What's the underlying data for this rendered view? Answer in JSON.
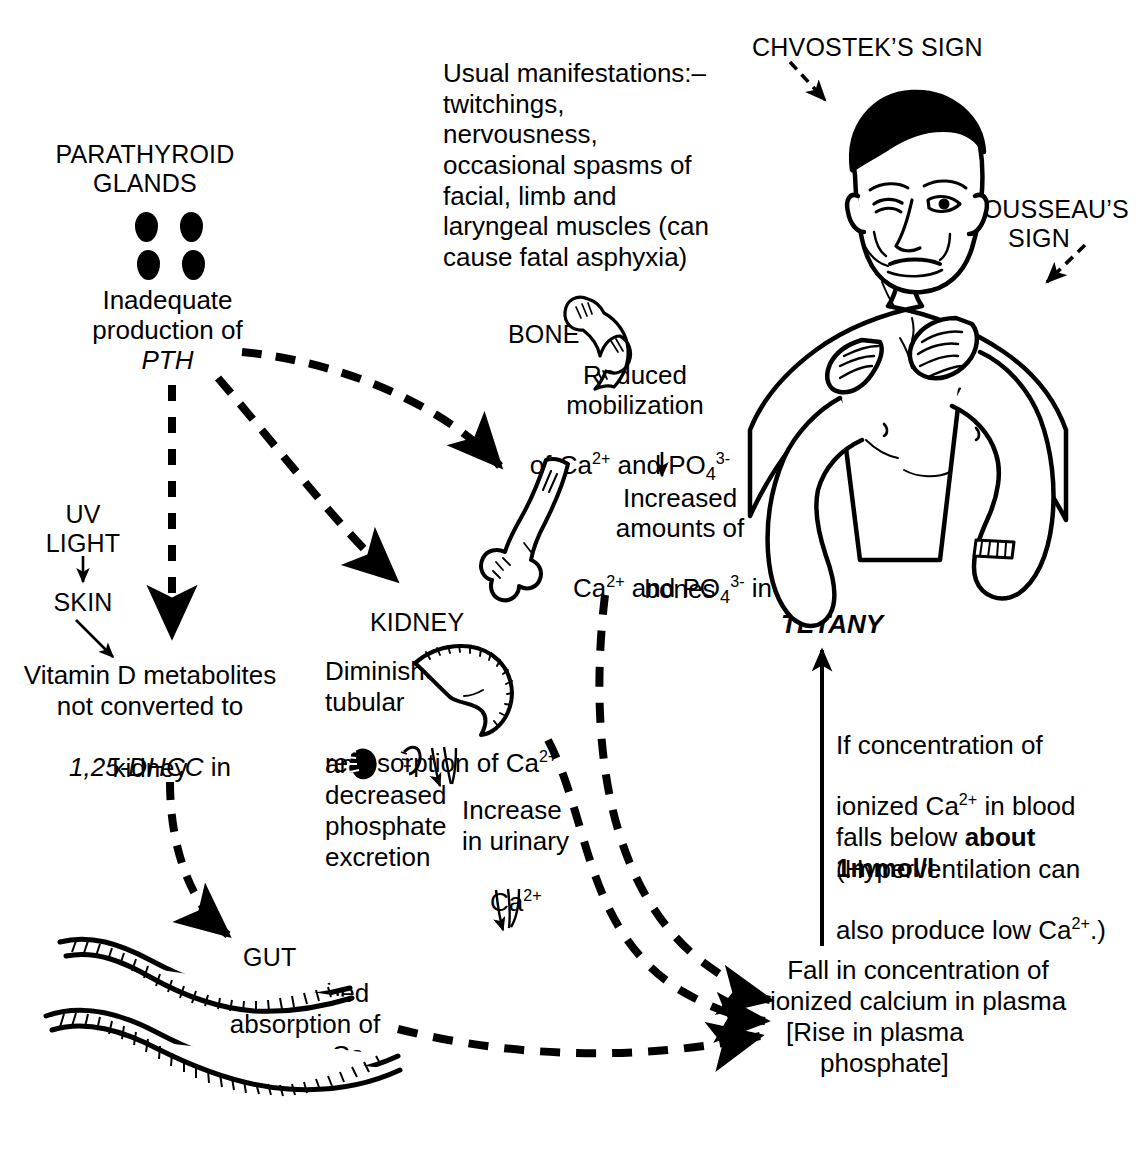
{
  "diagram": {
    "type": "medical-flow-diagram",
    "ink_color": "#000000",
    "background_color": "#ffffff"
  },
  "labels": {
    "parathyroid_glands": "PARATHYROID\nGLANDS",
    "inadequate_pth_line1": "Inadequate",
    "inadequate_pth_line2": "production of",
    "inadequate_pth_line3": "PTH",
    "uv_light": "UV\nLIGHT",
    "skin": "SKIN",
    "vitamin_d_line1": "Vitamin D metabolites",
    "vitamin_d_line2": "not converted to",
    "vitamin_d_line3a": "1,25-DHCC",
    "vitamin_d_line3b": " in",
    "vitamin_d_line4": "kidney",
    "manifestations": "Usual manifestations:–\ntwitchings,\nnervousness,\noccasional spasms of\nfacial, limb and\nlaryngeal muscles (can\ncause fatal asphyxia)",
    "bone": "BONE",
    "reduced_mobilization_line1": "Reduced",
    "reduced_mobilization_line2": "mobilization",
    "reduced_mobilization_line3_pre": "of Ca",
    "reduced_mobilization_line3_sup1": "2+",
    "reduced_mobilization_line3_mid": " and PO",
    "reduced_mobilization_line3_sub": "4",
    "reduced_mobilization_line3_sup2": "3-",
    "increased_amounts_line1": "Increased",
    "increased_amounts_line2": "amounts of",
    "increased_amounts_line3_pre": "Ca",
    "increased_amounts_line3_sup1": "2+",
    "increased_amounts_line3_mid": " and PO",
    "increased_amounts_line3_sub": "4",
    "increased_amounts_line3_sup2": "3-",
    "increased_amounts_line3_post": " in",
    "increased_amounts_line4": "bones",
    "kidney": "KIDNEY",
    "diminished_tubular_line1": "Diminished",
    "diminished_tubular_line2": "tubular",
    "diminished_tubular_line3_pre": "reabsorption of Ca",
    "diminished_tubular_line3_sup": "2+",
    "diminished_tubular_line4": "and",
    "diminished_tubular_line5": "decreased",
    "diminished_tubular_line6": "phosphate",
    "diminished_tubular_line7": "excretion",
    "increase_urinary_line1": "Increase",
    "increase_urinary_line2": "in urinary",
    "increase_urinary_line3_pre": "Ca",
    "increase_urinary_line3_sup": "2+",
    "gut": "GUT",
    "diminished_absorption_line1": "Diminished",
    "diminished_absorption_line2": "absorption of",
    "diminished_absorption_line3": "dietary Ca",
    "tetany": "TETANY",
    "tetany_note_line1": "If concentration of",
    "tetany_note_line2_pre": "ionized Ca",
    "tetany_note_line2_sup": "2+",
    "tetany_note_line2_post": " in blood",
    "tetany_note_line3_pre": "falls below ",
    "tetany_note_line3_bold": "about",
    "tetany_note_line4_bold": "1mmol/l",
    "tetany_note_line4_post": ".",
    "tetany_note_line5": "(Hyperventilation can",
    "tetany_note_line6_pre": "also produce low Ca",
    "tetany_note_line6_sup": "2+",
    "tetany_note_line6_post": ".)",
    "fall_concentration_line1": "Fall in concentration of",
    "fall_concentration_line2": "ionized calcium in plasma",
    "fall_concentration_line3": "[Rise in plasma",
    "fall_concentration_line4": "phosphate]",
    "chvostek_sign": "CHVOSTEK’S SIGN",
    "trousseau_sign": "TROUSSEAU’S\nSIGN"
  },
  "icons": {
    "parathyroid_glands_icon": "four-dark-oval-glands",
    "femur_head_icon": "proximal-femur-bone",
    "long_bone_icon": "long-bone-distal-end",
    "kidney_icon": "kidney-outline",
    "gut_icon": "intestine-loops",
    "patient_icon": "man-torso-with-carpal-spasm"
  },
  "connectors": [
    {
      "name": "pth-to-bone",
      "style": "dashed",
      "from": "Inadequate production of PTH",
      "to": "BONE"
    },
    {
      "name": "pth-to-kidney",
      "style": "dashed",
      "from": "Inadequate production of PTH",
      "to": "KIDNEY"
    },
    {
      "name": "pth-to-vitamin-d",
      "style": "dashed",
      "from": "Inadequate production of PTH",
      "to": "Vitamin D metabolites"
    },
    {
      "name": "vitamin-d-to-gut",
      "style": "dashed",
      "from": "Vitamin D metabolites not converted",
      "to": "GUT"
    },
    {
      "name": "uv-light-to-skin",
      "style": "solid",
      "from": "UV LIGHT",
      "to": "SKIN"
    },
    {
      "name": "skin-to-vitamin-d",
      "style": "solid",
      "from": "SKIN",
      "to": "Vitamin D metabolites"
    },
    {
      "name": "bone-mobilization-to-increased",
      "style": "solid-down-arrow",
      "from": "Reduced mobilization",
      "to": "Increased amounts"
    },
    {
      "name": "bones-to-fall",
      "style": "dashed",
      "from": "bones",
      "to": "Fall in concentration"
    },
    {
      "name": "kidney-to-fall",
      "style": "dashed",
      "from": "Increase in urinary Ca2+",
      "to": "Fall in concentration"
    },
    {
      "name": "gut-to-fall",
      "style": "dashed",
      "from": "Diminished absorption of dietary Ca",
      "to": "Fall in concentration"
    },
    {
      "name": "fall-to-tetany",
      "style": "solid",
      "from": "Fall in concentration",
      "to": "TETANY"
    },
    {
      "name": "chvostek-pointer",
      "style": "dashed",
      "from": "CHVOSTEK’S SIGN",
      "to": "face"
    },
    {
      "name": "trousseau-pointer",
      "style": "dashed",
      "from": "TROUSSEAU’S SIGN",
      "to": "hand"
    }
  ]
}
